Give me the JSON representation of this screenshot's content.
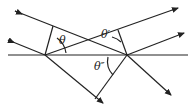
{
  "diagram": {
    "type": "ray-reflection-geometry",
    "labels": {
      "theta": "θ",
      "theta_prime": "θ′",
      "theta_double_prime": "θ″"
    },
    "colors": {
      "line": "#222222",
      "background": "#ffffff"
    }
  }
}
